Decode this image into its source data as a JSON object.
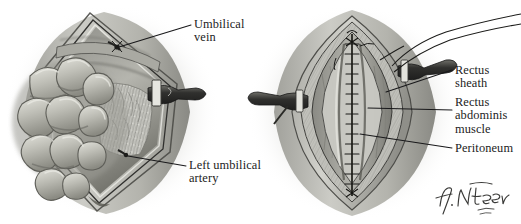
{
  "figure": {
    "background_color": "#ffffff",
    "ink_color": "#1c1c1c",
    "width": 521,
    "height": 224,
    "medium": "grayscale wash and pencil anatomical illustration",
    "panel_count": 2
  },
  "signature": {
    "name": "F. Netter",
    "credential": "M.D.",
    "position": "bottom-right"
  },
  "panels": [
    {
      "id": "left-panel",
      "name": "open-abdomen-with-eviscerated-bowel",
      "description": "Diamond-shaped abdominal wall incision held open, loops of small bowel eviscerated to the left, umbilical cord stump clamped at right",
      "structures": [
        "eviscerated small bowel loops",
        "cut edge of abdominal wall",
        "fatty peritoneal / preperitoneal tissue",
        "umbilical cord stump with clamp",
        "umbilical vein",
        "left umbilical artery"
      ]
    },
    {
      "id": "right-panel",
      "name": "closed-abdomen-with-midline-suture-line",
      "description": "Lens-shaped midline wound closed with interrupted sutures, layered abdominal wall retracted to show sheath, muscle and peritoneum; umbilical cord stump with suture ties at right",
      "structures": [
        "midline interrupted suture line",
        "rectus sheath",
        "rectus abdominis muscle",
        "peritoneum",
        "umbilical cord stump",
        "suture ties / threads"
      ]
    }
  ],
  "labels": [
    {
      "id": "umbilical-vein",
      "text": "Umbilical\nvein",
      "panel": "left-panel",
      "leader": {
        "from": [
          193,
          25
        ],
        "to": [
          117,
          46
        ]
      }
    },
    {
      "id": "left-umbilical-artery",
      "text": "Left umbilical\nartery",
      "panel": "left-panel",
      "leader": {
        "from": [
          188,
          166
        ],
        "to": [
          128,
          156
        ]
      }
    },
    {
      "id": "rectus-sheath",
      "text": "Rectus sheath",
      "panel": "right-panel",
      "leader": {
        "from": [
          453,
          70
        ],
        "to": [
          385,
          92
        ]
      }
    },
    {
      "id": "rectus-abdominis-muscle",
      "text": "Rectus\nabdominis\nmuscle",
      "panel": "right-panel",
      "leader": {
        "from": [
          453,
          110
        ],
        "to": [
          370,
          108
        ]
      }
    },
    {
      "id": "peritoneum",
      "text": "Peritoneum",
      "panel": "right-panel",
      "leader": {
        "from": [
          453,
          148
        ],
        "to": [
          362,
          135
        ]
      }
    }
  ],
  "palette": {
    "paper": "#ffffff",
    "wash_light": "#d9d9d6",
    "wash_mid": "#b9b9b4",
    "wash_dark": "#8d8d89",
    "shadow": "#5f5f5c",
    "deep": "#2e2e2c",
    "bowel_light": "#cfcfc8",
    "bowel_mid": "#aeaea6",
    "bowel_dark": "#87877f",
    "line": "#1c1c1c"
  }
}
